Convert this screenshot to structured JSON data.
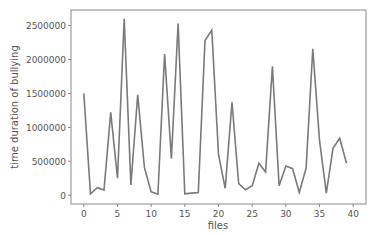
{
  "chart_data": {
    "type": "line",
    "title": "",
    "xlabel": "files",
    "ylabel": "time duration of bullying",
    "x": [
      0,
      1,
      2,
      3,
      4,
      5,
      6,
      7,
      8,
      9,
      10,
      11,
      12,
      13,
      14,
      15,
      16,
      17,
      18,
      19,
      20,
      21,
      22,
      23,
      24,
      25,
      26,
      27,
      28,
      29,
      30,
      31,
      32,
      33,
      34,
      35,
      36,
      37,
      38,
      39
    ],
    "series": [
      {
        "name": "time duration of bullying",
        "color": "#7a7a7a",
        "values": [
          1500000,
          20000,
          110000,
          75000,
          1220000,
          250000,
          2600000,
          150000,
          1480000,
          410000,
          50000,
          15000,
          2080000,
          540000,
          2530000,
          20000,
          30000,
          40000,
          2280000,
          2430000,
          600000,
          100000,
          1370000,
          170000,
          80000,
          140000,
          470000,
          340000,
          1900000,
          140000,
          430000,
          390000,
          40000,
          400000,
          2160000,
          810000,
          30000,
          690000,
          840000,
          470000
        ]
      }
    ],
    "xticks": [
      0,
      5,
      10,
      15,
      20,
      25,
      30,
      35,
      40
    ],
    "yticks": [
      0,
      500000,
      1000000,
      1500000,
      2000000,
      2500000
    ],
    "xlim": [
      -1.9,
      41.9
    ],
    "ylim": [
      -130000,
      2730000
    ],
    "grid": false,
    "legend": null
  }
}
